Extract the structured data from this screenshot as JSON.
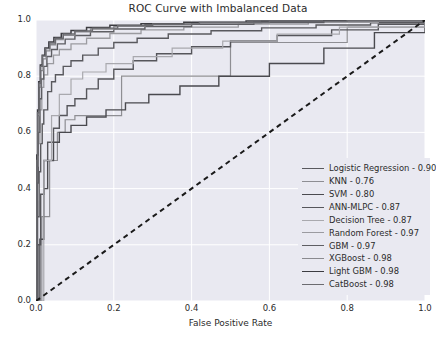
{
  "chart_data": {
    "type": "line",
    "title": "ROC Curve with Imbalanced Data",
    "xlabel": "False Positive Rate",
    "ylabel": "True Positive rate",
    "xlim": [
      0.0,
      1.0
    ],
    "ylim": [
      0.0,
      1.0
    ],
    "xticks": [
      "0.0",
      "0.2",
      "0.4",
      "0.6",
      "0.8",
      "1.0"
    ],
    "yticks": [
      "0.0",
      "0.2",
      "0.4",
      "0.6",
      "0.8",
      "1.0"
    ],
    "xtick_values": [
      0.0,
      0.2,
      0.4,
      0.6,
      0.8,
      1.0
    ],
    "ytick_values": [
      0.0,
      0.2,
      0.4,
      0.6,
      0.8,
      1.0
    ],
    "grid": true,
    "grid_color": "#ffffff",
    "plot_bg": "#e9e9f1",
    "figure_bg": "#ffffff",
    "legend_position": "lower right",
    "reference_line": {
      "name": "chance-diagonal",
      "style": "dashed",
      "color": "#1a1a1a",
      "points": [
        [
          0.0,
          0.0
        ],
        [
          1.0,
          1.0
        ]
      ]
    },
    "series": [
      {
        "name": "Logistic Regression",
        "auc": 0.9,
        "label": "Logistic Regression - 0.90",
        "color": "#59595e",
        "width": 1.4,
        "points": [
          [
            0,
            0
          ],
          [
            0.004,
            0.3
          ],
          [
            0.008,
            0.46
          ],
          [
            0.012,
            0.56
          ],
          [
            0.016,
            0.63
          ],
          [
            0.02,
            0.68
          ],
          [
            0.03,
            0.745
          ],
          [
            0.04,
            0.78
          ],
          [
            0.05,
            0.805
          ],
          [
            0.07,
            0.835
          ],
          [
            0.09,
            0.855
          ],
          [
            0.12,
            0.875
          ],
          [
            0.16,
            0.9
          ],
          [
            0.2,
            0.92
          ],
          [
            0.26,
            0.935
          ],
          [
            0.34,
            0.95
          ],
          [
            0.45,
            0.962
          ],
          [
            0.58,
            0.972
          ],
          [
            0.72,
            0.982
          ],
          [
            0.86,
            0.99
          ],
          [
            1,
            1
          ]
        ]
      },
      {
        "name": "KNN",
        "auc": 0.76,
        "label": "KNN - 0.76",
        "color": "#8e8e93",
        "width": 1.2,
        "points": [
          [
            0,
            0
          ],
          [
            0.015,
            0.3
          ],
          [
            0.035,
            0.5
          ],
          [
            0.055,
            0.6
          ],
          [
            0.075,
            0.645
          ],
          [
            0.1,
            0.66
          ],
          [
            0.22,
            0.8
          ],
          [
            0.5,
            0.92
          ],
          [
            0.8,
            0.975
          ],
          [
            1,
            1
          ]
        ]
      },
      {
        "name": "SVM",
        "auc": 0.8,
        "label": "SVM - 0.80",
        "color": "#4a4a4f",
        "width": 1.4,
        "points": [
          [
            0,
            0
          ],
          [
            0.01,
            0.22
          ],
          [
            0.02,
            0.4
          ],
          [
            0.03,
            0.5
          ],
          [
            0.045,
            0.565
          ],
          [
            0.06,
            0.6
          ],
          [
            0.09,
            0.625
          ],
          [
            0.13,
            0.655
          ],
          [
            0.18,
            0.68
          ],
          [
            0.23,
            0.705
          ],
          [
            0.29,
            0.735
          ],
          [
            0.37,
            0.765
          ],
          [
            0.47,
            0.8
          ],
          [
            0.6,
            0.845
          ],
          [
            0.74,
            0.9
          ],
          [
            0.87,
            0.955
          ],
          [
            1,
            1
          ]
        ]
      },
      {
        "name": "ANN-MLPC",
        "auc": 0.87,
        "label": "ANN-MLPC - 0.87",
        "color": "#56565b",
        "width": 1.4,
        "points": [
          [
            0,
            0
          ],
          [
            0.005,
            0.2
          ],
          [
            0.012,
            0.38
          ],
          [
            0.02,
            0.5
          ],
          [
            0.03,
            0.565
          ],
          [
            0.045,
            0.615
          ],
          [
            0.06,
            0.66
          ],
          [
            0.08,
            0.695
          ],
          [
            0.1,
            0.72
          ],
          [
            0.13,
            0.755
          ],
          [
            0.16,
            0.79
          ],
          [
            0.2,
            0.825
          ],
          [
            0.25,
            0.855
          ],
          [
            0.31,
            0.88
          ],
          [
            0.4,
            0.905
          ],
          [
            0.5,
            0.925
          ],
          [
            0.62,
            0.945
          ],
          [
            0.76,
            0.965
          ],
          [
            0.88,
            0.985
          ],
          [
            1,
            1
          ]
        ]
      },
      {
        "name": "Decision Tree",
        "auc": 0.87,
        "label": "Decision Tree - 0.87",
        "color": "#a9a9ae",
        "width": 1.2,
        "points": [
          [
            0,
            0
          ],
          [
            0.02,
            0.5
          ],
          [
            0.04,
            0.66
          ],
          [
            0.06,
            0.735
          ],
          [
            0.09,
            0.79
          ],
          [
            0.12,
            0.815
          ],
          [
            0.18,
            0.845
          ],
          [
            0.25,
            0.87
          ],
          [
            0.35,
            0.9
          ],
          [
            0.48,
            0.925
          ],
          [
            0.62,
            0.95
          ],
          [
            0.78,
            0.975
          ],
          [
            1,
            1
          ]
        ]
      },
      {
        "name": "Random Forest",
        "auc": 0.97,
        "label": "Random Forest - 0.97",
        "color": "#9b9ba0",
        "width": 1.3,
        "points": [
          [
            0,
            0
          ],
          [
            0.003,
            0.36
          ],
          [
            0.006,
            0.56
          ],
          [
            0.01,
            0.68
          ],
          [
            0.015,
            0.76
          ],
          [
            0.02,
            0.805
          ],
          [
            0.03,
            0.845
          ],
          [
            0.045,
            0.875
          ],
          [
            0.06,
            0.895
          ],
          [
            0.09,
            0.915
          ],
          [
            0.13,
            0.935
          ],
          [
            0.19,
            0.952
          ],
          [
            0.27,
            0.965
          ],
          [
            0.38,
            0.975
          ],
          [
            0.52,
            0.985
          ],
          [
            0.7,
            0.992
          ],
          [
            0.88,
            0.997
          ],
          [
            1,
            1
          ]
        ]
      },
      {
        "name": "GBM",
        "auc": 0.97,
        "label": "GBM - 0.97",
        "color": "#5e5e63",
        "width": 1.4,
        "points": [
          [
            0,
            0
          ],
          [
            0.003,
            0.42
          ],
          [
            0.006,
            0.6
          ],
          [
            0.01,
            0.72
          ],
          [
            0.014,
            0.79
          ],
          [
            0.02,
            0.835
          ],
          [
            0.028,
            0.87
          ],
          [
            0.04,
            0.895
          ],
          [
            0.055,
            0.915
          ],
          [
            0.075,
            0.932
          ],
          [
            0.1,
            0.945
          ],
          [
            0.14,
            0.958
          ],
          [
            0.2,
            0.968
          ],
          [
            0.28,
            0.977
          ],
          [
            0.4,
            0.985
          ],
          [
            0.56,
            0.991
          ],
          [
            0.74,
            0.996
          ],
          [
            1,
            1
          ]
        ]
      },
      {
        "name": "XGBoost",
        "auc": 0.98,
        "label": "XGBoost - 0.98",
        "color": "#8a8a8f",
        "width": 1.3,
        "points": [
          [
            0,
            0
          ],
          [
            0.002,
            0.48
          ],
          [
            0.005,
            0.66
          ],
          [
            0.008,
            0.76
          ],
          [
            0.012,
            0.82
          ],
          [
            0.018,
            0.862
          ],
          [
            0.026,
            0.89
          ],
          [
            0.036,
            0.912
          ],
          [
            0.05,
            0.93
          ],
          [
            0.07,
            0.945
          ],
          [
            0.1,
            0.958
          ],
          [
            0.14,
            0.968
          ],
          [
            0.2,
            0.977
          ],
          [
            0.28,
            0.984
          ],
          [
            0.4,
            0.99
          ],
          [
            0.58,
            0.995
          ],
          [
            0.78,
            0.998
          ],
          [
            1,
            1
          ]
        ]
      },
      {
        "name": "Light GBM",
        "auc": 0.98,
        "label": "Light GBM - 0.98",
        "color": "#3c3c41",
        "width": 1.5,
        "points": [
          [
            0,
            0
          ],
          [
            0.002,
            0.52
          ],
          [
            0.004,
            0.68
          ],
          [
            0.007,
            0.78
          ],
          [
            0.011,
            0.84
          ],
          [
            0.016,
            0.875
          ],
          [
            0.023,
            0.9
          ],
          [
            0.033,
            0.922
          ],
          [
            0.046,
            0.938
          ],
          [
            0.065,
            0.952
          ],
          [
            0.09,
            0.963
          ],
          [
            0.13,
            0.973
          ],
          [
            0.19,
            0.981
          ],
          [
            0.27,
            0.987
          ],
          [
            0.38,
            0.992
          ],
          [
            0.54,
            0.996
          ],
          [
            0.74,
            0.999
          ],
          [
            1,
            1
          ]
        ]
      },
      {
        "name": "CatBoost",
        "auc": 0.98,
        "label": "CatBoost - 0.98",
        "color": "#6b6b70",
        "width": 1.4,
        "points": [
          [
            0,
            0
          ],
          [
            0.002,
            0.5
          ],
          [
            0.004,
            0.67
          ],
          [
            0.0075,
            0.775
          ],
          [
            0.012,
            0.835
          ],
          [
            0.017,
            0.872
          ],
          [
            0.025,
            0.898
          ],
          [
            0.035,
            0.918
          ],
          [
            0.05,
            0.935
          ],
          [
            0.07,
            0.95
          ],
          [
            0.1,
            0.961
          ],
          [
            0.145,
            0.971
          ],
          [
            0.21,
            0.98
          ],
          [
            0.3,
            0.986
          ],
          [
            0.42,
            0.991
          ],
          [
            0.6,
            0.996
          ],
          [
            0.8,
            0.999
          ],
          [
            1,
            1
          ]
        ]
      }
    ]
  }
}
